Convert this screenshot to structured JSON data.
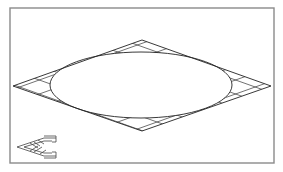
{
  "drawing": {
    "description": "Rhombus with inscribed ellipse; regions between ellipse and rhombus cross-hatched",
    "frame": {
      "x": 10,
      "y": 8,
      "width": 264,
      "height": 155,
      "color": "#8a8a8a"
    },
    "rhombus": {
      "top": [
        142,
        40
      ],
      "right": [
        271,
        86
      ],
      "bottom": [
        142,
        131
      ],
      "left": [
        13,
        86
      ]
    },
    "ellipse": {
      "cx": 141,
      "cy": 85,
      "rx": 91,
      "ry": 33
    },
    "hatch_pattern": "crosshatch",
    "line_color": "#222222"
  },
  "ucs_icon": {
    "label": "UCS icon",
    "apex": [
      17,
      147
    ],
    "upper_end": [
      56,
      138
    ],
    "lower_end": [
      56,
      157
    ]
  }
}
